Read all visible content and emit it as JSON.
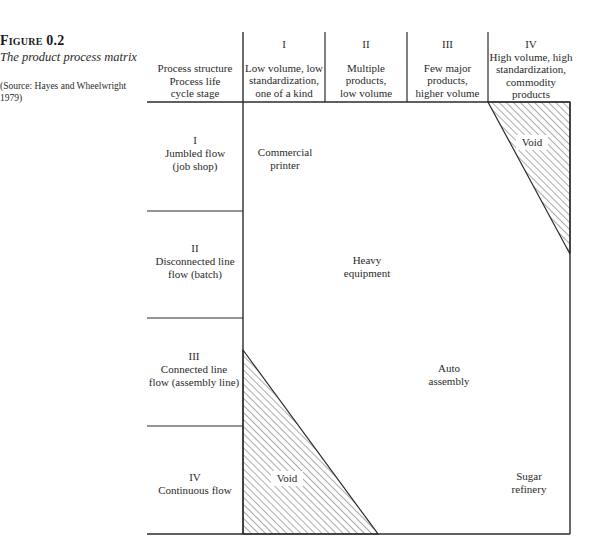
{
  "caption": {
    "figure_label": "Figure 0.2",
    "title": "The product process matrix",
    "source": "(Source: Hayes and Wheelwright 1979)"
  },
  "header": {
    "corner": [
      "Process structure",
      "Process life",
      "cycle stage"
    ],
    "columns": [
      {
        "roman": "I",
        "lines": [
          "Low volume, low",
          "standardization,",
          "one of a kind"
        ]
      },
      {
        "roman": "II",
        "lines": [
          "Multiple",
          "products,",
          "low volume"
        ]
      },
      {
        "roman": "III",
        "lines": [
          "Few major",
          "products,",
          "higher volume"
        ]
      },
      {
        "roman": "IV",
        "lines": [
          "High volume, high",
          "standardization,",
          "commodity",
          "products"
        ]
      }
    ]
  },
  "rows": [
    {
      "roman": "I",
      "lines": [
        "Jumbled flow",
        "(job shop)"
      ]
    },
    {
      "roman": "II",
      "lines": [
        "Disconnected line",
        "flow (batch)"
      ]
    },
    {
      "roman": "III",
      "lines": [
        "Connected line",
        "flow (assembly line)"
      ]
    },
    {
      "roman": "IV",
      "lines": [
        "Continuous flow"
      ]
    }
  ],
  "examples": [
    {
      "lines": [
        "Commercial",
        "printer"
      ]
    },
    {
      "lines": [
        "Heavy",
        "equipment"
      ]
    },
    {
      "lines": [
        "Auto",
        "assembly"
      ]
    },
    {
      "lines": [
        "Sugar",
        "refinery"
      ]
    }
  ],
  "voids": [
    {
      "label": "Void",
      "position": "top-right"
    },
    {
      "label": "Void",
      "position": "bottom-left"
    }
  ],
  "colors": {
    "line": "#2b2b2b",
    "hatch": "#444444",
    "text": "#2a2a2a"
  }
}
